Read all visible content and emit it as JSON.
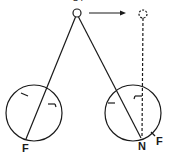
{
  "diagram": {
    "type": "optics-eye-fixation",
    "labels": {
      "top_partial": "OT",
      "left_fovea": "F",
      "right_nodal": "N",
      "right_fovea": "F"
    },
    "elements": {
      "object": {
        "cx": 77,
        "cy": 13,
        "r": 4,
        "style": "solid"
      },
      "object_shifted": {
        "cx": 143,
        "cy": 14,
        "r": 4,
        "style": "dashed"
      },
      "arrow": {
        "x1": 89,
        "y1": 13,
        "x2": 124,
        "y2": 13
      },
      "left_eye": {
        "cx": 34,
        "cy": 113,
        "r": 28
      },
      "right_eye": {
        "cx": 133,
        "cy": 113,
        "r": 28
      }
    },
    "colors": {
      "stroke": "#1a1a1a",
      "background": "#ffffff"
    }
  }
}
